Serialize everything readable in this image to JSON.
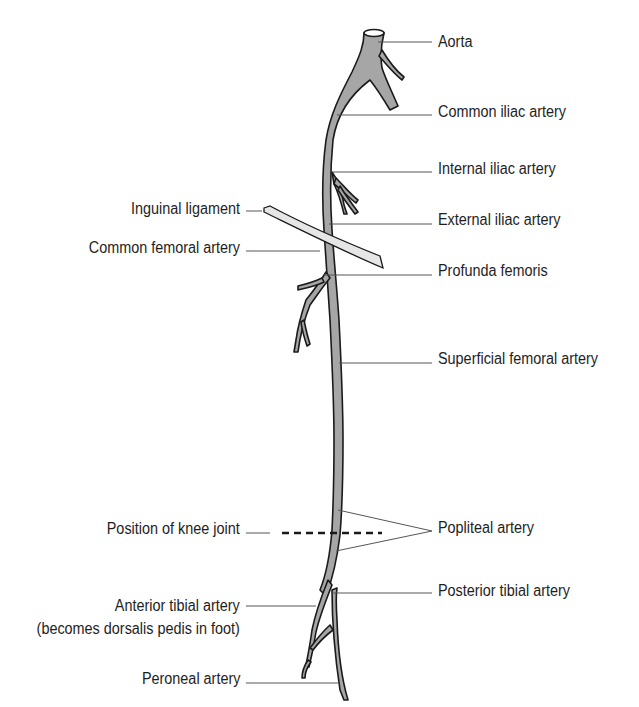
{
  "diagram": {
    "colors": {
      "vessel_fill": "#a6a6a6",
      "vessel_outline": "#1a1a1a",
      "ligament_fill": "#e6e6e6",
      "leader_line": "#555555",
      "text": "#1e1e1e"
    },
    "labels_right": [
      {
        "id": "aorta",
        "text": "Aorta"
      },
      {
        "id": "common-iliac",
        "text": "Common iliac artery"
      },
      {
        "id": "internal-iliac",
        "text": "Internal iliac artery"
      },
      {
        "id": "external-iliac",
        "text": "External iliac artery"
      },
      {
        "id": "profunda-femoris",
        "text": "Profunda femoris"
      },
      {
        "id": "superficial-femoral",
        "text": "Superficial femoral artery"
      },
      {
        "id": "popliteal",
        "text": "Popliteal artery"
      },
      {
        "id": "posterior-tibial",
        "text": "Posterior tibial artery"
      }
    ],
    "labels_left": [
      {
        "id": "inguinal-ligament",
        "text": "Inguinal ligament"
      },
      {
        "id": "common-femoral",
        "text": "Common femoral artery"
      },
      {
        "id": "knee-joint",
        "text": "Position of knee joint"
      },
      {
        "id": "anterior-tibial",
        "text": "Anterior tibial artery"
      },
      {
        "id": "anterior-tibial-note",
        "text": "(becomes dorsalis pedis in foot)"
      },
      {
        "id": "peroneal",
        "text": "Peroneal artery"
      }
    ]
  }
}
